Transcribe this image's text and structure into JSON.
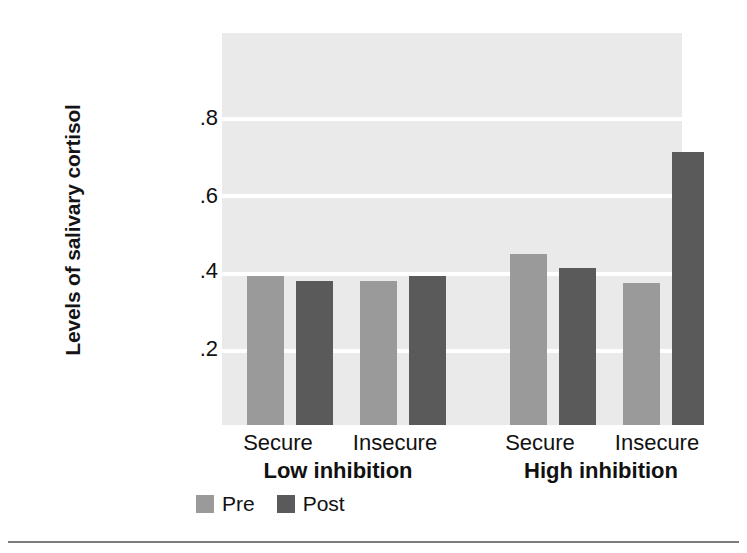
{
  "chart_data": {
    "type": "bar",
    "title": "",
    "xlabel": "",
    "ylabel": "Levels of salivary cortisol",
    "ylim": [
      0,
      0.95
    ],
    "yticks": [
      0.2,
      0.4,
      0.6,
      0.8
    ],
    "ytick_labels": [
      ".2",
      ".4",
      ".6",
      ".8"
    ],
    "grid": "horizontal-white-lines",
    "legend_position": "below-axis-left",
    "groups": [
      {
        "group_label": "Low inhibition",
        "categories": [
          "Secure",
          "Insecure"
        ]
      },
      {
        "group_label": "High inhibition",
        "categories": [
          "Secure",
          "Insecure"
        ]
      }
    ],
    "categories": [
      "Low inhibition / Secure",
      "Low inhibition / Insecure",
      "High inhibition / Secure",
      "High inhibition / Insecure"
    ],
    "series": [
      {
        "name": "Pre",
        "color": "#9a9a9a",
        "values": [
          0.39,
          0.375,
          0.445,
          0.37
        ]
      },
      {
        "name": "Post",
        "color": "#5a5a5a",
        "values": [
          0.375,
          0.39,
          0.41,
          0.71
        ]
      }
    ],
    "bars": [
      {
        "group": "Low inhibition",
        "category": "Secure",
        "series": "Pre",
        "value": 0.39
      },
      {
        "group": "Low inhibition",
        "category": "Secure",
        "series": "Post",
        "value": 0.375
      },
      {
        "group": "Low inhibition",
        "category": "Insecure",
        "series": "Pre",
        "value": 0.375
      },
      {
        "group": "Low inhibition",
        "category": "Insecure",
        "series": "Post",
        "value": 0.39
      },
      {
        "group": "High inhibition",
        "category": "Secure",
        "series": "Pre",
        "value": 0.445
      },
      {
        "group": "High inhibition",
        "category": "Secure",
        "series": "Post",
        "value": 0.41
      },
      {
        "group": "High inhibition",
        "category": "Insecure",
        "series": "Pre",
        "value": 0.37
      },
      {
        "group": "High inhibition",
        "category": "Insecure",
        "series": "Post",
        "value": 0.71
      }
    ],
    "colors": {
      "pre": "#9a9a9a",
      "post": "#5a5a5a",
      "plot_background": "#eaeaea",
      "gridline": "#ffffff",
      "text": "#111111"
    }
  },
  "axis": {
    "y_title": "Levels of salivary cortisol",
    "tick_08": ".8",
    "tick_06": ".6",
    "tick_04": ".4",
    "tick_02": ".2"
  },
  "categories": {
    "low_secure": "Secure",
    "low_insecure": "Insecure",
    "high_secure": "Secure",
    "high_insecure": "Insecure",
    "low_group": "Low inhibition",
    "high_group": "High inhibition"
  },
  "legend": {
    "pre": "Pre",
    "post": "Post"
  }
}
